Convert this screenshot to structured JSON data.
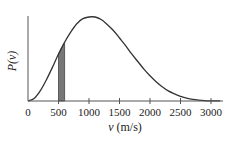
{
  "chart_data": {
    "type": "line",
    "title": "",
    "xlabel": "v (m/s)",
    "ylabel": "P(v)",
    "xlim": [
      0,
      3150
    ],
    "ylim": [
      0,
      1
    ],
    "x_ticks": [
      0,
      500,
      1000,
      1500,
      2000,
      2500,
      3000
    ],
    "x_tick_labels": [
      "0",
      "500",
      "1000",
      "1500",
      "2000",
      "2500",
      "3000"
    ],
    "y_ticks": [],
    "grid": false,
    "legend": null,
    "series": [
      {
        "name": "Maxwell-Boltzmann speed distribution",
        "x": [
          0,
          100,
          200,
          300,
          400,
          500,
          600,
          700,
          800,
          900,
          1000,
          1100,
          1200,
          1300,
          1400,
          1500,
          1600,
          1700,
          1800,
          1900,
          2000,
          2100,
          2200,
          2300,
          2400,
          2500,
          2600,
          2700,
          2800,
          2900,
          3000
        ],
        "values": [
          0,
          0.03,
          0.12,
          0.25,
          0.4,
          0.56,
          0.7,
          0.82,
          0.92,
          0.98,
          1.0,
          1.0,
          0.97,
          0.91,
          0.84,
          0.75,
          0.66,
          0.56,
          0.47,
          0.38,
          0.3,
          0.23,
          0.17,
          0.12,
          0.085,
          0.055,
          0.035,
          0.02,
          0.011,
          0.005,
          0.002
        ]
      }
    ],
    "annotations": [
      {
        "type": "shaded_region",
        "x_from": 500,
        "x_to": 600,
        "fill": "#777777"
      }
    ],
    "peak_v": 1100
  },
  "colors": {
    "curve": "#333333",
    "axis": "#555555",
    "shade": "#777777"
  }
}
